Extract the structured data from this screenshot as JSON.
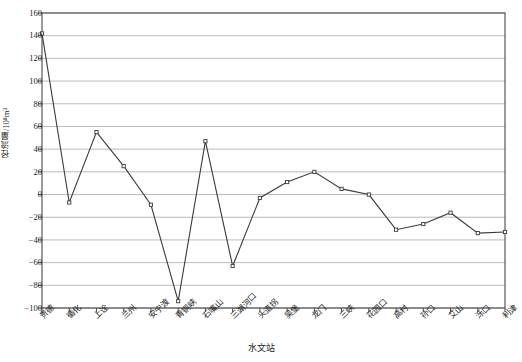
{
  "chart_data": {
    "type": "line",
    "title": "",
    "xlabel": "水文站",
    "ylabel": "径流量/10⁸m³",
    "ylim": [
      -100,
      160
    ],
    "ytick_step": 20,
    "grid": true,
    "legend": "none",
    "marker": "open-square",
    "line_color": "#3a3a3a",
    "grid_color": "#a8a8a8",
    "axis_color": "#555555",
    "categories": [
      "贵德",
      "循化",
      "上诠",
      "兰州",
      "安宁渡",
      "青铜峡",
      "石嘴山",
      "三湖河口",
      "头道拐",
      "吴堡",
      "龙门",
      "三峡",
      "花园口",
      "高村",
      "孙口",
      "艾山",
      "泺口",
      "利津"
    ],
    "values": [
      142,
      -7,
      55,
      25,
      -9,
      -94,
      47,
      -63,
      -3,
      11,
      20,
      5,
      0,
      -31,
      -26,
      -16,
      -34,
      -33
    ],
    "yticks": [
      160,
      140,
      120,
      100,
      80,
      60,
      40,
      20,
      0,
      -20,
      -40,
      -60,
      -80,
      -100
    ]
  }
}
